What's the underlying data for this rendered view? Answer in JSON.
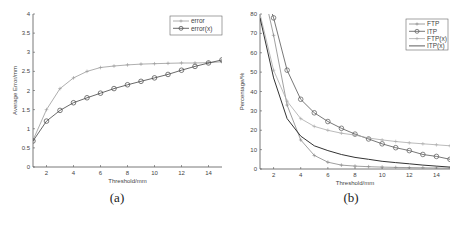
{
  "chart_data": [
    {
      "id": "a",
      "type": "line",
      "caption": "(a)",
      "title": "",
      "xlabel": "Threshold/mm",
      "ylabel": "Average Error/mm",
      "xlim": [
        1,
        15
      ],
      "ylim": [
        0,
        4
      ],
      "xticks": [
        2,
        4,
        6,
        8,
        10,
        12,
        14
      ],
      "yticks": [
        0,
        0.5,
        1,
        1.5,
        2,
        2.5,
        3,
        3.5,
        4
      ],
      "ytick_labels": [
        "0",
        "0.5",
        "1",
        "1.5",
        "2",
        "2.5",
        "3",
        "3.5",
        "4"
      ],
      "grid": false,
      "legend_position": "upper right",
      "x": [
        1,
        2,
        3,
        4,
        5,
        6,
        7,
        8,
        9,
        10,
        11,
        12,
        13,
        14,
        15
      ],
      "series": [
        {
          "name": "error",
          "marker": "plus",
          "color": "#999999",
          "values": [
            0.7,
            1.5,
            2.05,
            2.33,
            2.5,
            2.6,
            2.64,
            2.67,
            2.69,
            2.7,
            2.71,
            2.72,
            2.72,
            2.73,
            2.75
          ]
        },
        {
          "name": "error(x)",
          "marker": "circle",
          "color": "#444444",
          "values": [
            0.68,
            1.2,
            1.48,
            1.68,
            1.81,
            1.93,
            2.05,
            2.15,
            2.24,
            2.33,
            2.42,
            2.53,
            2.63,
            2.72,
            2.8
          ]
        }
      ]
    },
    {
      "id": "b",
      "type": "line",
      "caption": "(b)",
      "title": "",
      "xlabel": "Threshold/mm",
      "ylabel": "Percentage/%",
      "xlim": [
        1,
        15
      ],
      "ylim": [
        0,
        80
      ],
      "xticks": [
        2,
        4,
        6,
        8,
        10,
        12,
        14
      ],
      "yticks": [
        0,
        10,
        20,
        30,
        40,
        50,
        60,
        70,
        80
      ],
      "ytick_labels": [
        "0",
        "10",
        "20",
        "30",
        "40",
        "50",
        "60",
        "70",
        "80"
      ],
      "grid": false,
      "legend_position": "upper right",
      "x": [
        1,
        2,
        3,
        4,
        5,
        6,
        7,
        8,
        9,
        10,
        11,
        12,
        13,
        14,
        15
      ],
      "series": [
        {
          "name": "FTP",
          "marker": "plus",
          "color": "#888888",
          "values": [
            100,
            69,
            33,
            15,
            7,
            3.5,
            2,
            1.5,
            1.2,
            1,
            0.8,
            0.7,
            0.6,
            0.5,
            0.4
          ]
        },
        {
          "name": "ITP",
          "marker": "circle",
          "color": "#555555",
          "values": [
            100,
            78,
            51,
            36,
            29,
            24.5,
            21,
            18,
            15.5,
            13,
            11,
            9.5,
            7.5,
            6.5,
            5
          ]
        },
        {
          "name": "FTP(x)",
          "marker": "plus",
          "color": "#aaaaaa",
          "values": [
            80,
            51,
            35,
            26,
            22,
            20,
            18.5,
            17.5,
            16,
            15,
            14.2,
            13.5,
            13,
            12.5,
            12
          ]
        },
        {
          "name": "ITP(x)",
          "marker": "none",
          "color": "#333333",
          "values": [
            78,
            47,
            26,
            17,
            12,
            9.5,
            7.5,
            6,
            5,
            4,
            3.3,
            2.7,
            2,
            1.5,
            1
          ]
        }
      ]
    }
  ],
  "panels": {
    "a": {
      "caption": "(a)"
    },
    "b": {
      "caption": "(b)"
    }
  }
}
